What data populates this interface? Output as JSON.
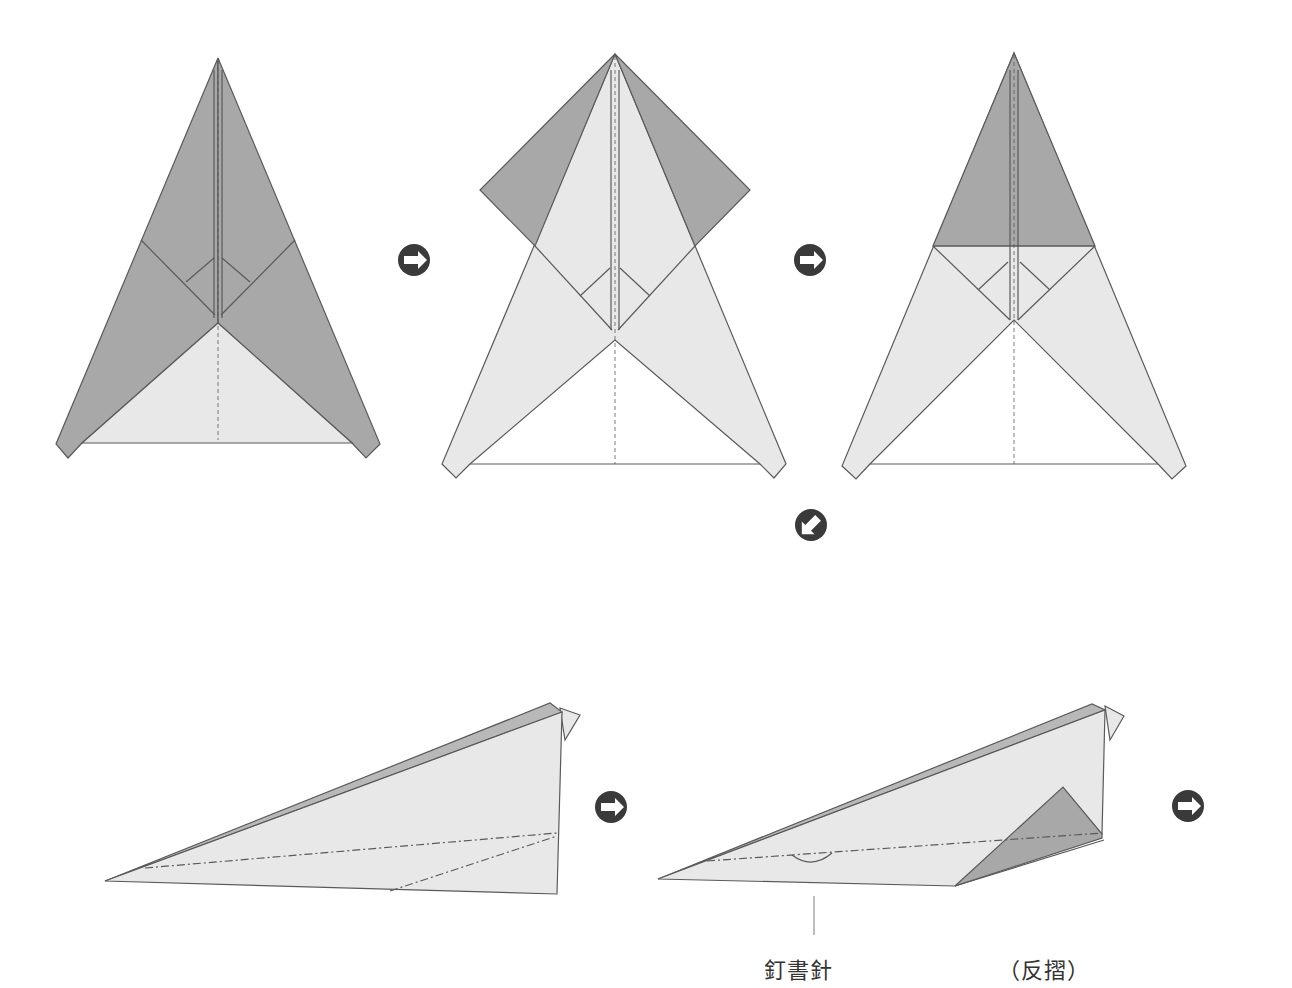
{
  "diagram": {
    "type": "origami-paper-airplane-instructions",
    "colors": {
      "paper_light": "#e8e8e8",
      "paper_dark": "#a8a8a8",
      "line": "#5a5a5a",
      "arrow": "#3a3a3a",
      "background": "#ffffff"
    },
    "steps": [
      {
        "id": "step-1",
        "description": "Triangular folded base with dark flaps"
      },
      {
        "id": "step-2",
        "description": "Top flaps folded outward"
      },
      {
        "id": "step-3",
        "description": "Tip folded down, dark triangle visible"
      },
      {
        "id": "step-4",
        "description": "Side view, folded in half"
      },
      {
        "id": "step-5",
        "description": "Side view with staple and reverse fold"
      }
    ],
    "arrows": [
      {
        "id": "arrow-1",
        "direction": "right"
      },
      {
        "id": "arrow-2",
        "direction": "right"
      },
      {
        "id": "arrow-3",
        "direction": "down-left"
      },
      {
        "id": "arrow-4",
        "direction": "right"
      },
      {
        "id": "arrow-5",
        "direction": "right"
      }
    ],
    "labels": {
      "staple": "釘書針",
      "reverse_fold": "（反摺）"
    }
  }
}
